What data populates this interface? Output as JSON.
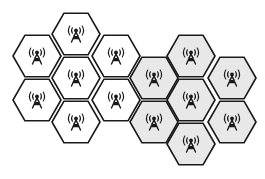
{
  "diagram": {
    "title": "",
    "colors": {
      "stroke": "#1a1a1a",
      "cluster_a_fill": "#ffffff",
      "cluster_b_fill": "#e8e8e8"
    },
    "hex_radius": 24,
    "clusters": [
      {
        "id": "cluster-a",
        "fill": "#ffffff",
        "cells": [
          {
            "id": "a-top",
            "cx": 76,
            "cy": 34,
            "icon": "radio-tower-icon"
          },
          {
            "id": "a-upper-left",
            "cx": 37,
            "cy": 56,
            "icon": "radio-tower-icon"
          },
          {
            "id": "a-center",
            "cx": 76,
            "cy": 78,
            "icon": "radio-tower-icon"
          },
          {
            "id": "a-upper-right",
            "cx": 116,
            "cy": 56,
            "icon": "radio-tower-icon"
          },
          {
            "id": "a-lower-left",
            "cx": 37,
            "cy": 100,
            "icon": "radio-tower-icon"
          },
          {
            "id": "a-lower-right",
            "cx": 116,
            "cy": 100,
            "icon": "radio-tower-icon"
          },
          {
            "id": "a-bottom",
            "cx": 76,
            "cy": 122,
            "icon": "radio-tower-icon"
          }
        ]
      },
      {
        "id": "cluster-b",
        "fill": "#e8e8e8",
        "cells": [
          {
            "id": "b-top",
            "cx": 191,
            "cy": 56,
            "icon": "radio-tower-icon"
          },
          {
            "id": "b-upper-left",
            "cx": 154,
            "cy": 78,
            "icon": "radio-tower-icon"
          },
          {
            "id": "b-center",
            "cx": 191,
            "cy": 100,
            "icon": "radio-tower-icon"
          },
          {
            "id": "b-upper-right",
            "cx": 232,
            "cy": 78,
            "icon": "radio-tower-icon"
          },
          {
            "id": "b-lower-left",
            "cx": 154,
            "cy": 122,
            "icon": "radio-tower-icon"
          },
          {
            "id": "b-lower-right",
            "cx": 232,
            "cy": 122,
            "icon": "radio-tower-icon"
          },
          {
            "id": "b-bottom",
            "cx": 191,
            "cy": 144,
            "icon": "radio-tower-icon"
          }
        ]
      }
    ]
  }
}
